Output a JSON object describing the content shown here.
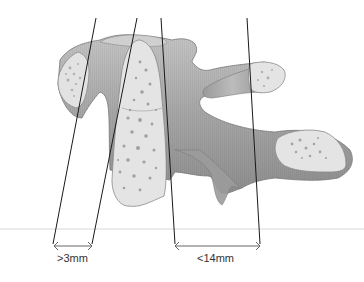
{
  "diagram": {
    "measurements": [
      {
        "id": "left-gap",
        "label": ">3mm"
      },
      {
        "id": "right-gap",
        "label": "<14mm"
      }
    ],
    "colors": {
      "cortical_shell": "#a8a8a8",
      "cortical_dark": "#8c8c8c",
      "cancellous_fill": "#e4e4e4",
      "trabecular_spots": "#8a8a8a",
      "outline": "#7a7a7a",
      "guide_line": "#1a1a1a",
      "baseline": "#d8d8d8",
      "arrow": "#555555"
    }
  }
}
